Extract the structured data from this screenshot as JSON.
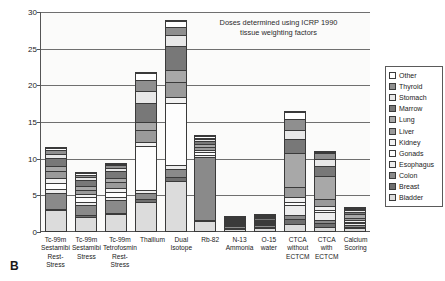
{
  "figure_letter": "B",
  "annotation": {
    "line1": "Doses determined using ICRP 1990",
    "line2": "tissue weighting factors"
  },
  "axes": {
    "ylabel": "Effective Dose (mSv)",
    "yticks": [
      0,
      5,
      10,
      15,
      20,
      25,
      30
    ],
    "ymin": 0,
    "ymax": 30
  },
  "legend": {
    "position": "right",
    "items": [
      {
        "label": "Other",
        "color": "#ffffff"
      },
      {
        "label": "Thyroid",
        "color": "#8f8f8f"
      },
      {
        "label": "Stomach",
        "color": "#e8e8e8"
      },
      {
        "label": "Marrow",
        "color": "#787878"
      },
      {
        "label": "Lung",
        "color": "#a8a8a8"
      },
      {
        "label": "Liver",
        "color": "#9a9a9a"
      },
      {
        "label": "Kidney",
        "color": "#f2f2f2"
      },
      {
        "label": "Gonads",
        "color": "#fdfdfd"
      },
      {
        "label": "Esophagus",
        "color": "#ededed"
      },
      {
        "label": "Colon",
        "color": "#8a8a8a"
      },
      {
        "label": "Breast",
        "color": "#6f6f6f"
      },
      {
        "label": "Bladder",
        "color": "#dcdcdc"
      }
    ]
  },
  "chart_data": {
    "type": "bar",
    "title": "",
    "subtitle": "",
    "xlabel": "",
    "ylabel": "Effective Dose (mSv)",
    "ylim": [
      0,
      30
    ],
    "grid": true,
    "stacked": true,
    "legend_position": "right",
    "annotations": [
      "Doses determined using ICRP 1990 tissue weighting factors"
    ],
    "categories": [
      "Tc-99m Sestamibi Rest-Stress",
      "Tc-99m Sestamibi Stress",
      "Tc-99m Tetrofosmin Rest-Stress",
      "Thallium",
      "Dual Isotope",
      "Rb-82",
      "N-13 Ammonia",
      "O-15 water",
      "CTCA without ECTCM",
      "CTCA with ECTCM",
      "Calcium Scoring"
    ],
    "category_labels_multiline": [
      [
        "Tc-99m",
        "Sestamibi",
        "Rest-Stress"
      ],
      [
        "Tc-99m",
        "Sestamibi",
        "Stress"
      ],
      [
        "Tc-99m",
        "Tetrofosmin",
        "Rest-Stress"
      ],
      [
        "Thallium"
      ],
      [
        "Dual Isotope"
      ],
      [
        "Rb-82"
      ],
      [
        "N-13",
        "Ammonia"
      ],
      [
        "O-15 water"
      ],
      [
        "CTCA",
        "without",
        "ECTCM"
      ],
      [
        "CTCA with",
        "ECTCM"
      ],
      [
        "Calcium",
        "Scoring"
      ]
    ],
    "totals": [
      11.3,
      7.8,
      9.2,
      21.6,
      28.7,
      12.8,
      1.5,
      1.9,
      16.3,
      10.8,
      3.0
    ],
    "series": [
      {
        "name": "Bladder",
        "color": "#dcdcdc",
        "values": [
          2.8,
          1.95,
          2.3,
          4.0,
          6.8,
          1.3,
          0.3,
          0.4,
          1.0,
          0.6,
          0.35
        ]
      },
      {
        "name": "Breast",
        "color": "#6f6f6f",
        "values": [
          0.25,
          0.18,
          0.2,
          0.35,
          0.5,
          0.2,
          0.08,
          0.1,
          0.7,
          0.5,
          0.2
        ]
      },
      {
        "name": "Colon",
        "color": "#8a8a8a",
        "values": [
          2.1,
          1.45,
          1.7,
          0.9,
          1.2,
          8.6,
          0.22,
          0.26,
          0.55,
          0.45,
          0.25
        ]
      },
      {
        "name": "Esophagus",
        "color": "#ededed",
        "values": [
          0.55,
          0.38,
          0.45,
          0.4,
          0.55,
          0.25,
          0.1,
          0.12,
          1.3,
          1.0,
          0.3
        ]
      },
      {
        "name": "Gonads",
        "color": "#fdfdfd",
        "values": [
          0.9,
          0.62,
          0.72,
          5.9,
          8.4,
          0.4,
          0.12,
          0.15,
          0.45,
          0.35,
          0.18
        ]
      },
      {
        "name": "Kidney",
        "color": "#f2f2f2",
        "values": [
          0.6,
          0.42,
          0.5,
          0.6,
          0.8,
          0.3,
          0.1,
          0.13,
          0.6,
          0.45,
          0.22
        ]
      },
      {
        "name": "Liver",
        "color": "#9a9a9a",
        "values": [
          0.95,
          0.65,
          0.78,
          1.6,
          2.1,
          0.45,
          0.14,
          0.17,
          1.4,
          1.05,
          0.3
        ]
      },
      {
        "name": "Lung",
        "color": "#a8a8a8",
        "values": [
          0.75,
          0.52,
          0.62,
          1.15,
          1.55,
          0.35,
          0.12,
          0.15,
          4.6,
          3.1,
          0.55
        ]
      },
      {
        "name": "Marrow",
        "color": "#787878",
        "values": [
          1.1,
          0.76,
          0.9,
          2.6,
          3.3,
          0.5,
          0.15,
          0.18,
          1.9,
          1.35,
          0.28
        ]
      },
      {
        "name": "Stomach",
        "color": "#e8e8e8",
        "values": [
          0.55,
          0.38,
          0.45,
          1.6,
          1.5,
          0.25,
          0.09,
          0.11,
          1.3,
          0.95,
          0.22
        ]
      },
      {
        "name": "Thyroid",
        "color": "#8f8f8f",
        "values": [
          0.45,
          0.31,
          0.38,
          1.5,
          1.1,
          0.15,
          0.05,
          0.07,
          1.5,
          0.8,
          0.1
        ]
      },
      {
        "name": "Other",
        "color": "#ffffff",
        "values": [
          0.3,
          0.28,
          0.2,
          1.0,
          0.9,
          0.25,
          0.03,
          0.06,
          1.0,
          0.2,
          0.05
        ]
      }
    ]
  }
}
